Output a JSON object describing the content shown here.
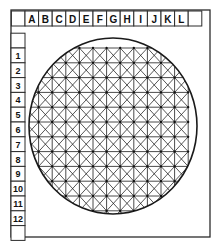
{
  "figure": {
    "background_color": "#ffffff",
    "line_color": "#1d1d1d",
    "frame_color": "#2b2b2b"
  },
  "frame": {
    "x": 11,
    "y": 10,
    "width": 199,
    "height": 227
  },
  "column_header": {
    "labels": [
      "A",
      "B",
      "C",
      "D",
      "E",
      "F",
      "G",
      "H",
      "I",
      "J",
      "K",
      "L"
    ],
    "leading_blank": true,
    "trailing_blank": true,
    "cell_width": 13.6,
    "cell_height": 15,
    "start_x": 25,
    "y": 11
  },
  "row_header": {
    "labels": [
      "1",
      "2",
      "3",
      "4",
      "5",
      "6",
      "7",
      "8",
      "9",
      "10",
      "11",
      "12"
    ],
    "leading_blank": true,
    "trailing_blank": true,
    "cell_width": 14,
    "cell_height": 14.8,
    "x": 11,
    "start_y": 48
  },
  "circle": {
    "center_x": 113,
    "center_y": 126,
    "radius_x": 84,
    "radius_y": 88,
    "outline_color": "#1a1a1a"
  },
  "lattice": {
    "pattern": "square-grid-with-both-diagonals",
    "spacing_x": 13.6,
    "spacing_y": 14.8,
    "origin_x": 25,
    "origin_y": 48,
    "columns": 13,
    "rows": 13,
    "node_dots": true,
    "node_dot_radius": 1.15
  },
  "legend": {
    "grid_label": "",
    "note": ""
  }
}
